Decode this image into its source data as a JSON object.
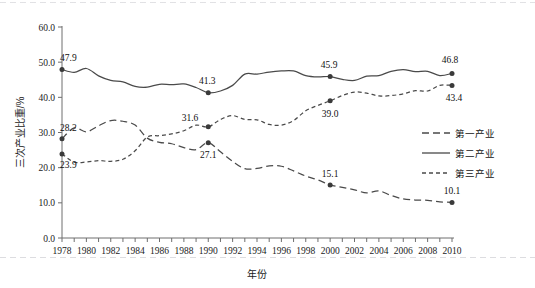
{
  "chart_data": {
    "type": "line",
    "title": "",
    "xlabel": "年份",
    "ylabel": "三次产业比重/%",
    "xlim": [
      1978,
      2010
    ],
    "ylim": [
      0,
      60
    ],
    "ytick_step": 10,
    "grid": false,
    "legend_position": "right",
    "x": [
      1978,
      1979,
      1980,
      1981,
      1982,
      1983,
      1984,
      1985,
      1986,
      1987,
      1988,
      1989,
      1990,
      1991,
      1992,
      1993,
      1994,
      1995,
      1996,
      1997,
      1998,
      1999,
      2000,
      2001,
      2002,
      2003,
      2004,
      2005,
      2006,
      2007,
      2008,
      2009,
      2010
    ],
    "xticklabels": [
      "1978",
      "1980",
      "1982",
      "1984",
      "1986",
      "1988",
      "1990",
      "1992",
      "1994",
      "1996",
      "1998",
      "2000",
      "2002",
      "2004",
      "2006",
      "2008",
      "2010"
    ],
    "yticklabels": [
      "0.0",
      "10.0",
      "20.0",
      "30.0",
      "40.0",
      "50.0",
      "60.0"
    ],
    "series": [
      {
        "name": "第一产业",
        "style": "dashed-long",
        "values": [
          28.2,
          31.3,
          30.2,
          31.9,
          33.4,
          33.2,
          32.1,
          28.4,
          27.2,
          26.8,
          25.7,
          25.1,
          27.1,
          24.5,
          21.8,
          19.7,
          19.8,
          20.5,
          20.4,
          19.1,
          17.6,
          16.5,
          15.1,
          14.4,
          13.7,
          12.8,
          13.4,
          12.1,
          11.1,
          10.8,
          10.7,
          10.3,
          10.1
        ]
      },
      {
        "name": "第二产业",
        "style": "solid",
        "values": [
          47.9,
          47.1,
          48.2,
          46.1,
          44.8,
          44.4,
          43.1,
          42.9,
          43.7,
          43.6,
          43.8,
          42.8,
          41.3,
          41.8,
          43.4,
          46.6,
          46.6,
          47.2,
          47.5,
          47.5,
          46.2,
          45.8,
          45.9,
          45.1,
          44.8,
          46.0,
          46.2,
          47.4,
          47.9,
          47.3,
          47.4,
          46.2,
          46.8
        ]
      },
      {
        "name": "第三产业",
        "style": "dashed-short",
        "values": [
          23.9,
          21.6,
          21.6,
          22.0,
          21.8,
          22.4,
          24.8,
          28.7,
          29.1,
          29.6,
          30.5,
          32.1,
          31.6,
          33.7,
          34.8,
          33.7,
          33.6,
          32.3,
          32.1,
          33.4,
          36.2,
          37.7,
          39.0,
          40.5,
          41.5,
          41.2,
          40.4,
          40.5,
          41.0,
          41.9,
          41.8,
          43.4,
          43.4
        ]
      }
    ],
    "annotations": [
      {
        "series": "第二产业",
        "year": 1978,
        "value": 47.9,
        "text": "47.9"
      },
      {
        "series": "第二产业",
        "year": 1990,
        "value": 41.3,
        "text": "41.3"
      },
      {
        "series": "第二产业",
        "year": 2000,
        "value": 45.9,
        "text": "45.9"
      },
      {
        "series": "第二产业",
        "year": 2010,
        "value": 46.8,
        "text": "46.8"
      },
      {
        "series": "第一产业",
        "year": 1978,
        "value": 28.2,
        "text": "28.2"
      },
      {
        "series": "第一产业",
        "year": 1990,
        "value": 27.1,
        "text": "27.1"
      },
      {
        "series": "第一产业",
        "year": 2000,
        "value": 15.1,
        "text": "15.1"
      },
      {
        "series": "第一产业",
        "year": 2010,
        "value": 10.1,
        "text": "10.1"
      },
      {
        "series": "第三产业",
        "year": 1978,
        "value": 23.9,
        "text": "23.9"
      },
      {
        "series": "第三产业",
        "year": 1990,
        "value": 31.6,
        "text": "31.6"
      },
      {
        "series": "第三产业",
        "year": 2000,
        "value": 39.0,
        "text": "39.0"
      },
      {
        "series": "第三产业",
        "year": 2010,
        "value": 43.4,
        "text": "43.4"
      }
    ],
    "colors": {
      "line": "#4a4a4a",
      "marker": "#3a3a3a",
      "axis": "#6e6e6e",
      "text": "#111111"
    }
  },
  "legend": {
    "items": [
      {
        "label": "第一产业",
        "style": "dashed-long"
      },
      {
        "label": "第二产业",
        "style": "solid"
      },
      {
        "label": "第三产业",
        "style": "dashed-short"
      }
    ]
  },
  "axes": {
    "y_title": "三次产业比重/%",
    "x_title": "年份"
  }
}
